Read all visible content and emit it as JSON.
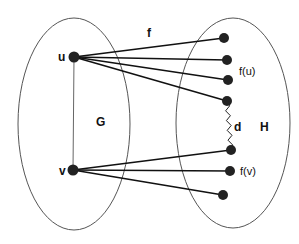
{
  "diagram": {
    "colors": {
      "stroke": "#111111",
      "node": "#222222",
      "ellipse": "#555555",
      "background": "#ffffff"
    },
    "sets": [
      {
        "id": "G",
        "label": "G",
        "cx": 74,
        "cy": 124,
        "rx": 56,
        "ry": 106,
        "label_x": 96,
        "label_y": 126
      },
      {
        "id": "H",
        "label": "H",
        "cx": 233,
        "cy": 123,
        "rx": 57,
        "ry": 105,
        "label_x": 260,
        "label_y": 131
      }
    ],
    "nodes": {
      "u": {
        "label": "u",
        "x": 74,
        "y": 57,
        "label_x": 58,
        "label_y": 61
      },
      "v": {
        "label": "v",
        "x": 73,
        "y": 170,
        "label_x": 59,
        "label_y": 175
      },
      "h1": {
        "x": 224,
        "y": 38
      },
      "h2": {
        "x": 227,
        "y": 60,
        "label": "f(u)",
        "label_x": 239,
        "label_y": 75
      },
      "h3": {
        "x": 228,
        "y": 80
      },
      "h4": {
        "x": 227,
        "y": 101
      },
      "h5": {
        "x": 231,
        "y": 150
      },
      "h6": {
        "x": 230,
        "y": 171,
        "label": "f(v)",
        "label_x": 240,
        "label_y": 175
      },
      "h7": {
        "x": 223,
        "y": 195
      }
    },
    "labels": {
      "f": {
        "text": "f",
        "x": 147,
        "y": 37
      },
      "d": {
        "text": "d",
        "x": 234,
        "y": 131
      }
    },
    "edges_from_u": [
      "h1",
      "h2",
      "h3",
      "h4"
    ],
    "edges_from_v": [
      "h5",
      "h6",
      "h7"
    ],
    "edge_uv": [
      "u",
      "v"
    ],
    "path_d": {
      "from": "h4",
      "to": "h5",
      "label": "d"
    }
  }
}
